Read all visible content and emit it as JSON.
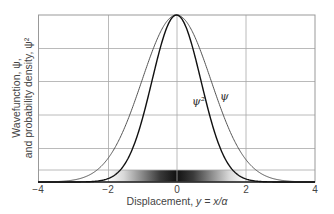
{
  "chart_data": {
    "type": "line",
    "title": "",
    "xlabel": "Displacement, y = x/α",
    "ylabel_line1": "Wavefunction, ψ,",
    "ylabel_line2": "and probability density, ψ²",
    "xlim": [
      -4,
      4
    ],
    "ylim": [
      0,
      1
    ],
    "x_ticks": [
      "-4",
      "-2",
      "0",
      "2",
      "4"
    ],
    "grid": true,
    "legend": "none (inline curve labels)",
    "series": [
      {
        "name": "ψ",
        "label": "ψ",
        "formula": "exp(-y^2/2)",
        "x": [
          -4,
          -3,
          -2,
          -1.5,
          -1,
          -0.5,
          0,
          0.5,
          1,
          1.5,
          2,
          3,
          4
        ],
        "values": [
          0.0003,
          0.011,
          0.135,
          0.325,
          0.607,
          0.882,
          1.0,
          0.882,
          0.607,
          0.325,
          0.135,
          0.011,
          0.0003
        ],
        "color": "#555555"
      },
      {
        "name": "ψ²",
        "label": "ψ²",
        "formula": "exp(-y^2)",
        "x": [
          -4,
          -3,
          -2,
          -1.5,
          -1,
          -0.5,
          0,
          0.5,
          1,
          1.5,
          2,
          3,
          4
        ],
        "values": [
          0.0,
          0.0001,
          0.018,
          0.105,
          0.368,
          0.779,
          1.0,
          0.779,
          0.368,
          0.105,
          0.018,
          0.0001,
          0.0
        ],
        "color": "#111111"
      }
    ],
    "annotations": [
      {
        "text": "ψ²",
        "near_x": 0.75,
        "near_y": 0.45
      },
      {
        "text": "ψ",
        "near_x": 1.35,
        "near_y": 0.5
      }
    ],
    "density_band": "grayscale gradient bar along x-axis, darkest at y=0, intensity ∝ ψ²"
  },
  "labels": {
    "tick_m4": "−4",
    "tick_m2": "−2",
    "tick_0": "0",
    "tick_2": "2",
    "tick_4": "4",
    "xlabel_prefix": "Displacement, ",
    "xlabel_var": "y = x/α",
    "ylabel_line1": "Wavefunction, ψ,",
    "ylabel_line2": "and probability density, ψ²",
    "psi2": "ψ²",
    "psi": "ψ"
  }
}
